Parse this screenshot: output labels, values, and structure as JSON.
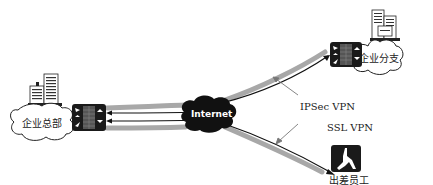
{
  "diagram": {
    "nodes": {
      "hq": {
        "label": "企业总部",
        "icon": "office-building-icon"
      },
      "internet": {
        "label": "Internet",
        "icon": "cloud-icon"
      },
      "branch": {
        "label": "企业分支",
        "icon": "office-building-icon"
      },
      "traveler": {
        "label": "出差员工",
        "icon": "walking-person-icon"
      }
    },
    "links": {
      "ipsec": {
        "label": "IPSec VPN"
      },
      "ssl": {
        "label": "SSL VPN"
      }
    },
    "colors": {
      "tunnel": "#a8a8a8",
      "line": "#111111",
      "device": "#1a1a1a",
      "internet_cloud": "#111111"
    }
  }
}
